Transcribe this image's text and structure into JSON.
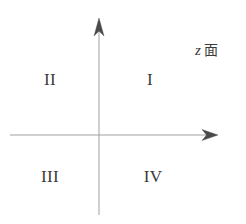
{
  "figure": {
    "background_color": "#ffffff",
    "width": 246,
    "height": 224
  },
  "axes": {
    "color": "#a0a0a0",
    "arrow_color": "#4a4a4a",
    "stroke_width": 1,
    "origin": {
      "x": 99,
      "y": 135
    },
    "horizontal": {
      "name": "real-axis",
      "x_start": 10,
      "x_end": 218,
      "y": 135,
      "arrow_at": "right"
    },
    "vertical": {
      "name": "imaginary-axis",
      "y_start": 215,
      "y_end": 18,
      "x": 99,
      "arrow_at": "top"
    }
  },
  "labels": {
    "plane": {
      "variable": "z",
      "plane_word": "面",
      "full": "z 面"
    },
    "quadrants": [
      {
        "id": "I",
        "text": "I",
        "x": 150,
        "y": 79
      },
      {
        "id": "II",
        "text": "II",
        "x": 50,
        "y": 79
      },
      {
        "id": "III",
        "text": "III",
        "x": 50,
        "y": 176
      },
      {
        "id": "IV",
        "text": "IV",
        "x": 153,
        "y": 176
      }
    ]
  },
  "colors": {
    "background": "#ffffff",
    "axis_line": "#a0a0a0",
    "arrow_head": "#4a4a4a",
    "text": "#3a3a3a"
  }
}
